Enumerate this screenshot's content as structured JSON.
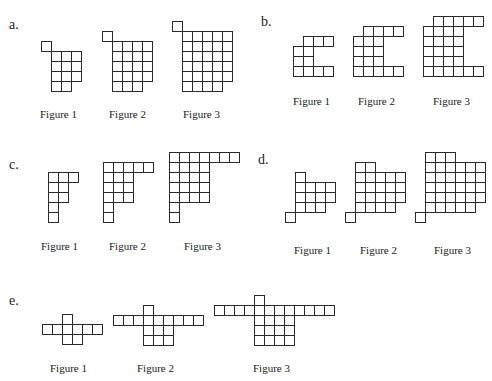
{
  "cell_size": 10,
  "sections": [
    {
      "id": "a",
      "label": "a.",
      "label_pos": [
        9,
        18
      ],
      "figures": [
        {
          "caption": "Figure 1",
          "origin": [
            41,
            41
          ],
          "caption_pos": [
            40,
            108
          ],
          "rows": [
            [
              0
            ],
            [
              1,
              2,
              3
            ],
            [
              1,
              2,
              3
            ],
            [
              1,
              2,
              3
            ],
            [
              1,
              2
            ]
          ]
        },
        {
          "caption": "Figure 2",
          "origin": [
            102,
            31
          ],
          "caption_pos": [
            109,
            108
          ],
          "rows": [
            [
              0
            ],
            [
              1,
              2,
              3,
              4
            ],
            [
              1,
              2,
              3,
              4
            ],
            [
              1,
              2,
              3,
              4
            ],
            [
              1,
              2,
              3,
              4
            ],
            [
              1,
              2,
              3
            ]
          ]
        },
        {
          "caption": "Figure 3",
          "origin": [
            172,
            21
          ],
          "caption_pos": [
            183,
            108
          ],
          "rows": [
            [
              0
            ],
            [
              1,
              2,
              3,
              4,
              5
            ],
            [
              1,
              2,
              3,
              4,
              5
            ],
            [
              1,
              2,
              3,
              4,
              5
            ],
            [
              1,
              2,
              3,
              4,
              5
            ],
            [
              1,
              2,
              3,
              4,
              5
            ],
            [
              1,
              2,
              3,
              4
            ]
          ]
        }
      ]
    },
    {
      "id": "b",
      "label": "b.",
      "label_pos": [
        261,
        15
      ],
      "figures": [
        {
          "caption": "Figure 1",
          "origin": [
            293,
            36
          ],
          "caption_pos": [
            293,
            95
          ],
          "rows": [
            [
              1,
              2,
              3
            ],
            [
              0,
              1
            ],
            [
              0,
              1
            ],
            [
              0,
              1,
              2,
              3
            ]
          ]
        },
        {
          "caption": "Figure 2",
          "origin": [
            353,
            26
          ],
          "caption_pos": [
            358,
            95
          ],
          "rows": [
            [
              1,
              2,
              4,
              3
            ],
            [
              0,
              1,
              2
            ],
            [
              0,
              1,
              2
            ],
            [
              0,
              1,
              2
            ],
            [
              0,
              1,
              2,
              3,
              4
            ]
          ]
        },
        {
          "caption": "Figure 3",
          "origin": [
            423,
            16
          ],
          "caption_pos": [
            433,
            95
          ],
          "rows": [
            [
              1,
              2,
              3,
              4,
              5
            ],
            [
              0,
              1,
              2,
              3
            ],
            [
              0,
              1,
              2,
              3
            ],
            [
              0,
              1,
              2,
              3
            ],
            [
              0,
              1,
              2,
              3
            ],
            [
              0,
              1,
              2,
              3,
              4,
              5
            ]
          ]
        }
      ]
    },
    {
      "id": "c",
      "label": "c.",
      "label_pos": [
        9,
        158
      ],
      "figures": [
        {
          "caption": "Figure 1",
          "origin": [
            48,
            172
          ],
          "caption_pos": [
            41,
            240
          ],
          "rows": [
            [
              0,
              1,
              2
            ],
            [
              0,
              1
            ],
            [
              0,
              1
            ],
            [
              0
            ],
            [
              0
            ]
          ]
        },
        {
          "caption": "Figure 2",
          "origin": [
            103,
            162
          ],
          "caption_pos": [
            109,
            240
          ],
          "rows": [
            [
              0,
              1,
              2,
              3,
              4
            ],
            [
              0,
              1,
              2
            ],
            [
              0,
              1,
              2
            ],
            [
              0,
              1,
              2
            ],
            [
              0
            ],
            [
              0
            ]
          ]
        },
        {
          "caption": "Figure 3",
          "origin": [
            169,
            152
          ],
          "caption_pos": [
            184,
            240
          ],
          "rows": [
            [
              0,
              1,
              2,
              3,
              4,
              5,
              6
            ],
            [
              0,
              1,
              2,
              3
            ],
            [
              0,
              1,
              2,
              3
            ],
            [
              0,
              1,
              2,
              3
            ],
            [
              0,
              1,
              2,
              3
            ],
            [
              0
            ],
            [
              0
            ]
          ]
        }
      ]
    },
    {
      "id": "d",
      "label": "d.",
      "label_pos": [
        258,
        153
      ],
      "figures": [
        {
          "caption": "Figure 1",
          "origin": [
            285,
            172
          ],
          "caption_pos": [
            294,
            244
          ],
          "rows": [
            [
              1
            ],
            [
              1,
              2,
              3,
              4
            ],
            [
              1,
              2,
              3,
              4
            ],
            [
              1,
              2,
              3
            ],
            [
              0
            ]
          ]
        },
        {
          "caption": "Figure 2",
          "origin": [
            345,
            162
          ],
          "caption_pos": [
            360,
            244
          ],
          "rows": [
            [
              1,
              2
            ],
            [
              1,
              2,
              3,
              4,
              5
            ],
            [
              1,
              2,
              3,
              4,
              5
            ],
            [
              1,
              2,
              3,
              4,
              5
            ],
            [
              1,
              2,
              3,
              4
            ],
            [
              0
            ]
          ]
        },
        {
          "caption": "Figure 3",
          "origin": [
            415,
            152
          ],
          "caption_pos": [
            434,
            244
          ],
          "rows": [
            [
              1,
              2,
              3
            ],
            [
              1,
              2,
              3,
              4,
              5,
              6
            ],
            [
              1,
              2,
              3,
              4,
              5,
              6
            ],
            [
              1,
              2,
              3,
              4,
              5,
              6
            ],
            [
              1,
              2,
              3,
              4,
              5,
              6
            ],
            [
              1,
              2,
              3,
              4,
              5
            ],
            [
              0
            ]
          ]
        }
      ]
    },
    {
      "id": "e",
      "label": "e.",
      "label_pos": [
        9,
        294
      ],
      "figures": [
        {
          "caption": "Figure 1",
          "origin": [
            42,
            314
          ],
          "caption_pos": [
            50,
            362
          ],
          "rows": [
            [
              2
            ],
            [
              0,
              1,
              2,
              3,
              4,
              5
            ],
            [
              2,
              3
            ]
          ]
        },
        {
          "caption": "Figure 2",
          "origin": [
            113,
            305
          ],
          "caption_pos": [
            137,
            362
          ],
          "rows": [
            [
              3
            ],
            [
              0,
              1,
              2,
              3,
              4,
              5,
              6,
              7,
              8
            ],
            [
              3,
              4,
              5
            ],
            [
              3,
              4,
              5
            ]
          ]
        },
        {
          "caption": "Figure 3",
          "origin": [
            214,
            295
          ],
          "caption_pos": [
            253,
            362
          ],
          "rows": [
            [
              4
            ],
            [
              0,
              1,
              2,
              3,
              4,
              5,
              6,
              7,
              8,
              9,
              10,
              11
            ],
            [
              4,
              5,
              6,
              7
            ],
            [
              4,
              5,
              6,
              7
            ],
            [
              4,
              5,
              6,
              7
            ]
          ]
        }
      ]
    }
  ]
}
